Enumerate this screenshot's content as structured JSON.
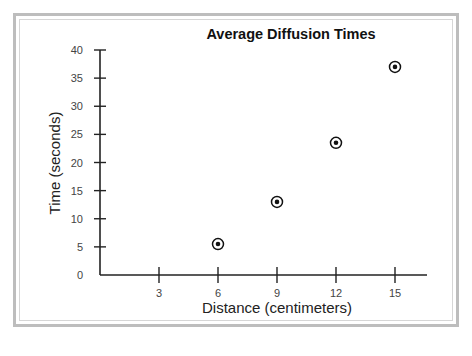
{
  "chart_data": {
    "type": "scatter",
    "title": "Average Diffusion Times",
    "xlabel": "Distance (centimeters)",
    "ylabel": "Time (seconds)",
    "x_ticks": [
      3,
      6,
      9,
      12,
      15
    ],
    "y_ticks": [
      0,
      5,
      10,
      15,
      20,
      25,
      30,
      35,
      40
    ],
    "xlim": [
      0,
      16.5
    ],
    "ylim": [
      0,
      40
    ],
    "grid": false,
    "legend": null,
    "marker": "circled-dot",
    "series": [
      {
        "name": "Average diffusion time",
        "points": [
          {
            "x": 6,
            "y": 5.5
          },
          {
            "x": 9,
            "y": 13
          },
          {
            "x": 12,
            "y": 23.5
          },
          {
            "x": 15,
            "y": 37
          }
        ]
      }
    ]
  },
  "colors": {
    "frame": "#bdbdbd",
    "axis": "#222222",
    "marker": "#111111"
  }
}
